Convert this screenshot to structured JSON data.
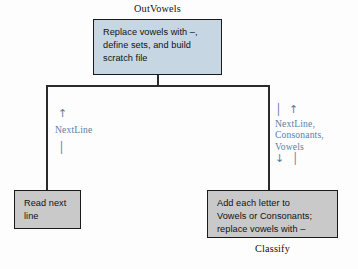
{
  "diagram": {
    "title_top": "OutVowels",
    "title_bottom": "Classify",
    "boxes": {
      "outvowels": "Replace vowels with –,\ndefine sets, and build\nscratch file",
      "read_next": "Read next\nline",
      "classify": "Add each letter to\nVowels or Consonants;\nreplace vowels with –"
    },
    "annotations": {
      "left_label": "NextLine",
      "left_arrow_up": "↑",
      "left_tail": "│",
      "right_label": "NextLine,\nConsonants,\nVowels",
      "right_arrow_up": "│ ↑",
      "right_arrow_down": "↓ │"
    },
    "colors": {
      "box_blue": "#c6d6e3",
      "box_gray": "#c9c9c9",
      "border": "#1a1a1a",
      "annotation": "#5b7fa6",
      "background": "#fdfdfd"
    }
  }
}
